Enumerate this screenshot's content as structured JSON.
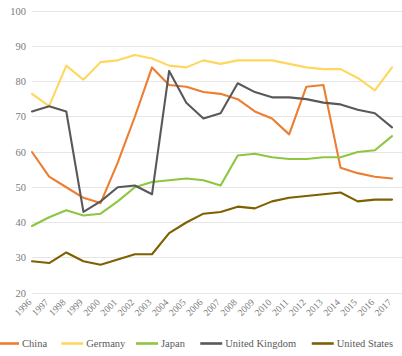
{
  "chart_data": {
    "type": "line",
    "title": "",
    "subtitle": "",
    "xlabel": "",
    "ylabel": "",
    "ylim": [
      20,
      100
    ],
    "yticks": [
      20,
      30,
      40,
      50,
      60,
      70,
      80,
      90,
      100
    ],
    "grid": true,
    "legend_position": "bottom",
    "x": [
      1996,
      1997,
      1998,
      1999,
      2000,
      2001,
      2002,
      2003,
      2004,
      2005,
      2006,
      2007,
      2008,
      2009,
      2010,
      2011,
      2012,
      2013,
      2014,
      2015,
      2016,
      2017
    ],
    "categories": [
      "1996",
      "1997",
      "1998",
      "1999",
      "2000",
      "2001",
      "2002",
      "2003",
      "2004",
      "2005",
      "2006",
      "2007",
      "2008",
      "2009",
      "2010",
      "2011",
      "2012",
      "2013",
      "2014",
      "2015",
      "2016",
      "2017"
    ],
    "series": [
      {
        "name": "China",
        "color": "#ED7D31",
        "values": [
          60,
          53,
          50,
          47,
          45.5,
          57,
          70,
          84,
          79,
          78.5,
          77,
          76.5,
          75,
          71.5,
          69.5,
          65,
          78.5,
          79,
          55.5,
          54,
          53,
          52.5
        ]
      },
      {
        "name": "Germany",
        "color": "#FFD75E",
        "values": [
          76.5,
          73,
          84.5,
          80.5,
          85.5,
          86,
          87.5,
          86.5,
          84.5,
          84,
          86,
          85,
          86,
          86,
          86,
          85,
          84,
          83.5,
          83.5,
          81,
          77.5,
          84
        ]
      },
      {
        "name": "Japan",
        "color": "#8DC63F",
        "values": [
          39,
          41.5,
          43.5,
          42,
          42.5,
          46,
          50,
          51.5,
          52,
          52.5,
          52,
          50.5,
          59,
          59.5,
          58.5,
          58,
          58,
          58.5,
          58.5,
          60,
          60.5,
          64.5
        ]
      },
      {
        "name": "United Kingdom",
        "color": "#595959",
        "values": [
          71.5,
          73,
          71.5,
          43,
          46,
          50,
          50.5,
          48,
          83,
          74,
          69.5,
          71,
          79.5,
          77,
          75.5,
          75.5,
          75,
          74,
          73.5,
          72,
          71,
          67
        ]
      },
      {
        "name": "United States",
        "color": "#7F6000",
        "values": [
          29,
          28.5,
          31.5,
          29,
          28,
          29.5,
          31,
          31,
          37,
          40,
          42.5,
          43,
          44.5,
          44,
          46,
          47,
          47.5,
          48,
          48.5,
          46,
          46.5,
          46.5
        ]
      }
    ]
  },
  "legend": {
    "items": [
      {
        "label": "China",
        "color": "#ED7D31"
      },
      {
        "label": "Germany",
        "color": "#FFD75E"
      },
      {
        "label": "Japan",
        "color": "#8DC63F"
      },
      {
        "label": "United Kingdom",
        "color": "#595959"
      },
      {
        "label": "United States",
        "color": "#7F6000"
      }
    ]
  },
  "axes": {
    "y_tick_labels": [
      "100",
      "90",
      "80",
      "70",
      "60",
      "50",
      "40",
      "30",
      "20"
    ],
    "x_tick_labels": [
      "1996",
      "1997",
      "1998",
      "1999",
      "2000",
      "2001",
      "2002",
      "2003",
      "2004",
      "2005",
      "2006",
      "2007",
      "2008",
      "2009",
      "2010",
      "2011",
      "2012",
      "2013",
      "2014",
      "2015",
      "2016",
      "2017"
    ]
  }
}
